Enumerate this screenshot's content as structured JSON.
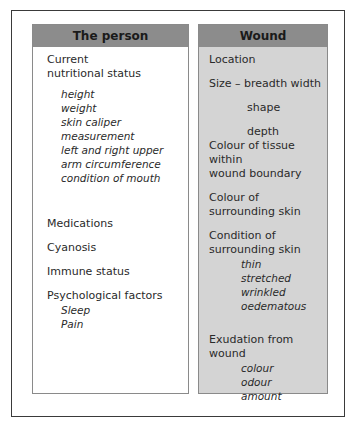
{
  "left_column": {
    "header": "The person",
    "nutrition": {
      "title_line1": "Current",
      "title_line2": "nutritional status",
      "subitems": [
        "height",
        "weight",
        "skin caliper measurement",
        "left and right upper",
        "arm circumference",
        "condition of mouth"
      ]
    },
    "medications": "Medications",
    "cyanosis": "Cyanosis",
    "immune": "Immune status",
    "psych": {
      "title": "Psychological factors",
      "subitems": [
        "Sleep",
        "Pain"
      ]
    }
  },
  "right_column": {
    "header": "Wound",
    "location": "Location",
    "size": {
      "title": "Size – breadth width",
      "shape": "shape",
      "depth": "depth"
    },
    "tissue_colour": {
      "line1": "Colour of tissue within",
      "line2": "wound boundary"
    },
    "surrounding_colour": {
      "line1": "Colour of",
      "line2": "surrounding skin"
    },
    "surrounding_condition": {
      "line1": "Condition of",
      "line2": "surrounding skin",
      "subitems": [
        "thin",
        "stretched",
        "wrinkled",
        "oedematous"
      ]
    },
    "exudation": {
      "title": "Exudation from wound",
      "subitems": [
        "colour",
        "odour",
        "amount"
      ]
    }
  },
  "colors": {
    "header_band": "#8c8c8c",
    "right_column_bg": "#d4d4d4",
    "frame": "#3a3a3a"
  }
}
